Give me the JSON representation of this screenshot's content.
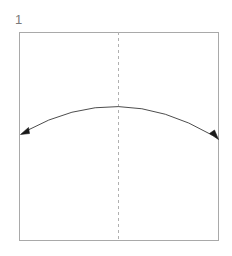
{
  "diagram": {
    "kind": "origami-step-diagram",
    "step_number": "1",
    "canvas": {
      "width": 232,
      "height": 256,
      "background": "#ffffff"
    },
    "paper": {
      "name": "square-paper-outline",
      "shape": "square",
      "x": 19,
      "y": 32,
      "width": 200,
      "height": 209,
      "stroke_color": "#a9a9a9",
      "stroke_width": 1,
      "fill": "#ffffff"
    },
    "crease_line": {
      "name": "vertical-center-crease",
      "style": "dashed",
      "orientation": "vertical",
      "x": 118.5,
      "y_start": 32,
      "y_end": 241,
      "stroke_color": "#b0b0b0",
      "stroke_width": 1,
      "dash_pattern": "3 3"
    },
    "fold_arrow": {
      "name": "double-headed-fold-arrow",
      "type": "arc",
      "heads": "both",
      "start_x": 23,
      "start_y": 132,
      "apex_x": 118.5,
      "apex_y": 107,
      "end_x": 215,
      "end_y": 136,
      "stroke_color": "#4d4d4d",
      "stroke_width": 1,
      "arrowhead_fill": "#1a1a1a",
      "arrowhead_size": 7
    }
  }
}
